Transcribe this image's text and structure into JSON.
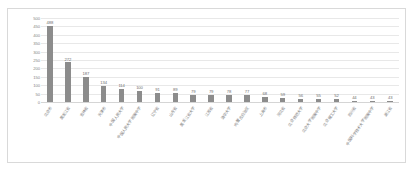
{
  "chart_data": {
    "type": "bar",
    "title": "",
    "subtitle": "",
    "xlabel": "",
    "ylabel": "",
    "ylim": [
      0,
      500
    ],
    "yticks": [
      500,
      450,
      400,
      350,
      300,
      250,
      200,
      150,
      100,
      50,
      0
    ],
    "grid": true,
    "legend": false,
    "bar_color": "#8c8c8c",
    "grid_color": "#e8e8e8",
    "border_color": "#d9d9d9",
    "label_color": "#7a7a7a",
    "categories": [
      "北京市",
      "黑龙江省",
      "吉林省",
      "天津市",
      "中国人民大学",
      "中国人民大学附属中学",
      "辽宁省",
      "山东省",
      "黑龙江省大学",
      "江苏省",
      "清华大学",
      "内蒙古自治区",
      "上海市",
      "河北省",
      "北京师范大学",
      "北京大学附属中学",
      "北京理工大学",
      "四川省",
      "中国科学技术大学附属中学",
      "浙江省"
    ],
    "values": [
      488,
      272,
      187,
      134,
      114,
      100,
      91,
      89,
      79,
      79,
      78,
      77,
      68,
      59,
      56,
      55,
      52,
      44,
      43,
      43
    ]
  }
}
